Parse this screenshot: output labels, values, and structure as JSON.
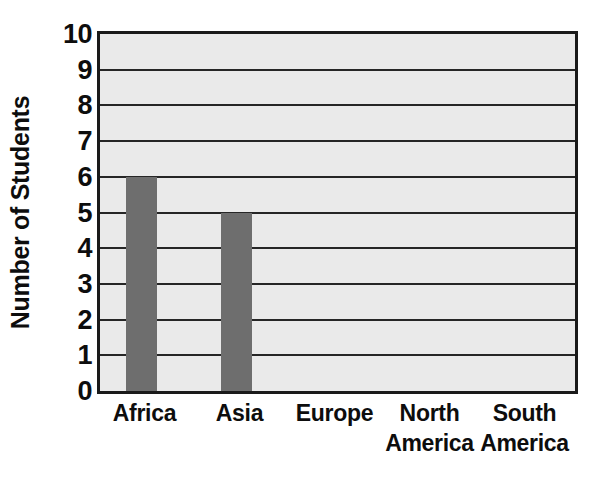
{
  "chart_data": {
    "type": "bar",
    "title": "",
    "subtitle": "",
    "xlabel": "",
    "ylabel": "Number of Students",
    "categories": [
      "Africa",
      "Asia",
      "Europe",
      "North America",
      "South America"
    ],
    "category_lines": [
      [
        "Africa"
      ],
      [
        "Asia"
      ],
      [
        "Europe"
      ],
      [
        "North",
        "America"
      ],
      [
        "South",
        "America"
      ]
    ],
    "values": [
      6,
      5,
      0,
      0,
      0
    ],
    "ylim": [
      0,
      10
    ],
    "ytick_step": 1,
    "yticks": [
      "10",
      "9",
      "8",
      "7",
      "6",
      "5",
      "4",
      "3",
      "2",
      "1",
      "0"
    ],
    "ytick_values": [
      10,
      9,
      8,
      7,
      6,
      5,
      4,
      3,
      2,
      1,
      0
    ],
    "grid": true,
    "grid_axis": "y",
    "legend": false,
    "legend_position": "none",
    "annotations": []
  },
  "style": {
    "plot_background": "#eaeaea",
    "page_background": "#ffffff",
    "bar_color": "#6e6e6e",
    "axis_color": "#1a1a1a",
    "gridline_color": "#262626",
    "text_color": "#0d0d0d"
  }
}
